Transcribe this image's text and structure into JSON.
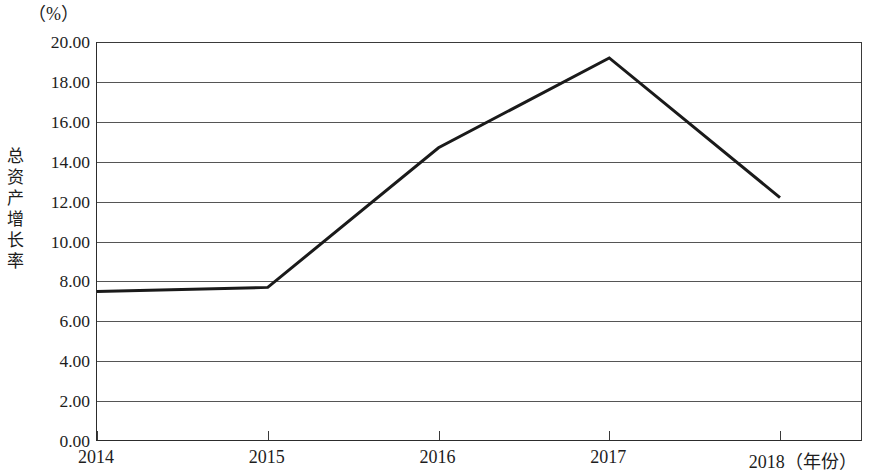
{
  "chart_data": {
    "type": "line",
    "title": "",
    "unit_label": "（%）",
    "ylabel": "总资产增长率",
    "xlabel": "（年份）",
    "categories": [
      "2014",
      "2015",
      "2016",
      "2017",
      "2018"
    ],
    "series": [
      {
        "name": "总资产增长率",
        "values": [
          7.5,
          7.7,
          14.7,
          19.2,
          12.2
        ]
      }
    ],
    "ylim": [
      0.0,
      20.0
    ],
    "ytick_step": 2.0,
    "ytick_labels": [
      "20.00",
      "18.00",
      "16.00",
      "14.00",
      "12.00",
      "10.00",
      "8.00",
      "6.00",
      "4.00",
      "2.00",
      "0.00"
    ],
    "ytick_values": [
      20.0,
      18.0,
      16.0,
      14.0,
      12.0,
      10.0,
      8.0,
      6.0,
      4.0,
      2.0,
      0.0
    ],
    "grid": true,
    "grid_axis": "y",
    "legend": "none",
    "line_color": "#1a1a1a",
    "line_width": 3,
    "markers": "none",
    "x_axis_last_label": "2018（年份）"
  },
  "axis": {
    "y_title_chars": [
      "总",
      "资",
      "产",
      "增",
      "长",
      "率"
    ]
  }
}
